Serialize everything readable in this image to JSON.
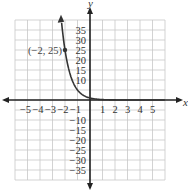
{
  "chart_data": {
    "type": "line",
    "title": "",
    "xlabel": "x",
    "ylabel": "y",
    "xlim": [
      -6,
      6
    ],
    "ylim": [
      -40,
      40
    ],
    "grid": true,
    "x_ticks": [
      "−5",
      "−4",
      "−3",
      "−2",
      "−1",
      "1",
      "2",
      "3",
      "4",
      "5"
    ],
    "y_ticks": [
      "35",
      "30",
      "25",
      "20",
      "15",
      "10",
      "−10",
      "−15",
      "−20",
      "−25",
      "−30",
      "−35"
    ],
    "series": [
      {
        "name": "y = (1/5)^x",
        "x": [
          -2.3,
          -2,
          -1.5,
          -1,
          -0.5,
          0,
          1,
          2,
          3,
          4,
          5
        ],
        "y": [
          40.5,
          25,
          11.2,
          5,
          2.24,
          1,
          0.2,
          0.04,
          0.008,
          0.0016,
          0.0003
        ]
      }
    ],
    "annotations": [
      {
        "x": -2,
        "y": 25,
        "label": "(−2, 25)"
      }
    ]
  },
  "labels": {
    "x_axis": "x",
    "y_axis": "y",
    "point": "(−2, 25)"
  },
  "ticks": {
    "x": [
      {
        "v": -5,
        "t": "−5"
      },
      {
        "v": -4,
        "t": "−4"
      },
      {
        "v": -3,
        "t": "−3"
      },
      {
        "v": -2,
        "t": "−2"
      },
      {
        "v": -1,
        "t": "−1"
      },
      {
        "v": 1,
        "t": "1"
      },
      {
        "v": 2,
        "t": "2"
      },
      {
        "v": 3,
        "t": "3"
      },
      {
        "v": 4,
        "t": "4"
      },
      {
        "v": 5,
        "t": "5"
      }
    ],
    "y": [
      "35",
      "30",
      "25",
      "20",
      "15",
      "10",
      "−10",
      "−15",
      "−20",
      "−25",
      "−30",
      "−35"
    ]
  }
}
